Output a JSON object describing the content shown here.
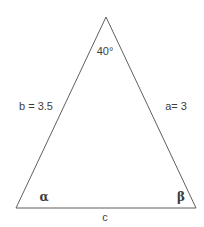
{
  "diagram": {
    "type": "triangle-geometry-figure",
    "apex_angle_label": "40°",
    "side_b_label": "b = 3.5",
    "side_a_label": "a= 3",
    "angle_alpha_label": "α",
    "angle_beta_label": "β",
    "side_c_label": "c",
    "colors": {
      "line": "#5f5f5f",
      "text": "#3d3d3d",
      "background": "#ffffff"
    }
  }
}
